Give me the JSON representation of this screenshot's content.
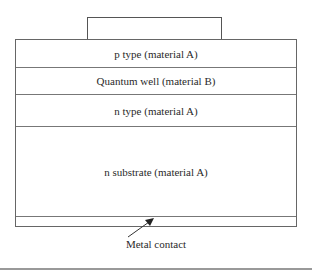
{
  "diagram": {
    "top_contact": {
      "label": ""
    },
    "layers": [
      {
        "label": "p type (material A)"
      },
      {
        "label": "Quantum well (material B)"
      },
      {
        "label": "n type (material A)"
      },
      {
        "label": "n substrate (material A)"
      },
      {
        "label": ""
      }
    ],
    "annotation": {
      "label": "Metal contact",
      "arrow": {
        "from": [
          128,
          237
        ],
        "to": [
          153,
          219
        ]
      }
    },
    "colors": {
      "line": "#666666",
      "text": "#2a2a2a",
      "background": "#ffffff"
    }
  }
}
